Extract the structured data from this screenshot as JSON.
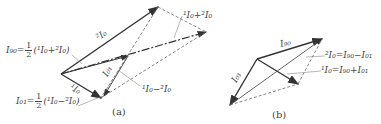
{
  "figure_a": {
    "caption": "(a)",
    "labels": {
      "i90_lhs": "I₉₀=",
      "i90_rhs": "(¹I₀+²I₀)",
      "i01_lhs": "I₀₁=",
      "i01_rhs": "(¹I₀−²I₀)",
      "frac_num": "1",
      "frac_den": "2",
      "two_i0": "²I₀",
      "one_i0": "¹I₀",
      "i01_vec": "I₀₁",
      "sum": "¹I₀+²I₀",
      "diff": "¹I₀−²I₀"
    }
  },
  "figure_b": {
    "caption": "(b)",
    "labels": {
      "i90": "I₉₀",
      "i01": "I₀₁",
      "two_i0_eq": "²I₀=I₉₀−I₀₁",
      "one_i0_eq": "¹I₀=I₉₀+I₀₁"
    }
  },
  "colors": {
    "line": "#333333",
    "dashed": "#666666",
    "leader": "#888888"
  }
}
